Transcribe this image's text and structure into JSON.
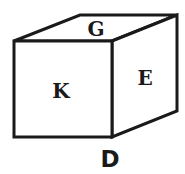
{
  "diagram": {
    "type": "cube",
    "faces": {
      "top": {
        "label": "G"
      },
      "front": {
        "label": "K"
      },
      "right": {
        "label": "E"
      },
      "bottom": {
        "label": "D"
      }
    },
    "colors": {
      "stroke": "#1a1a1a",
      "background": "#ffffff"
    }
  }
}
